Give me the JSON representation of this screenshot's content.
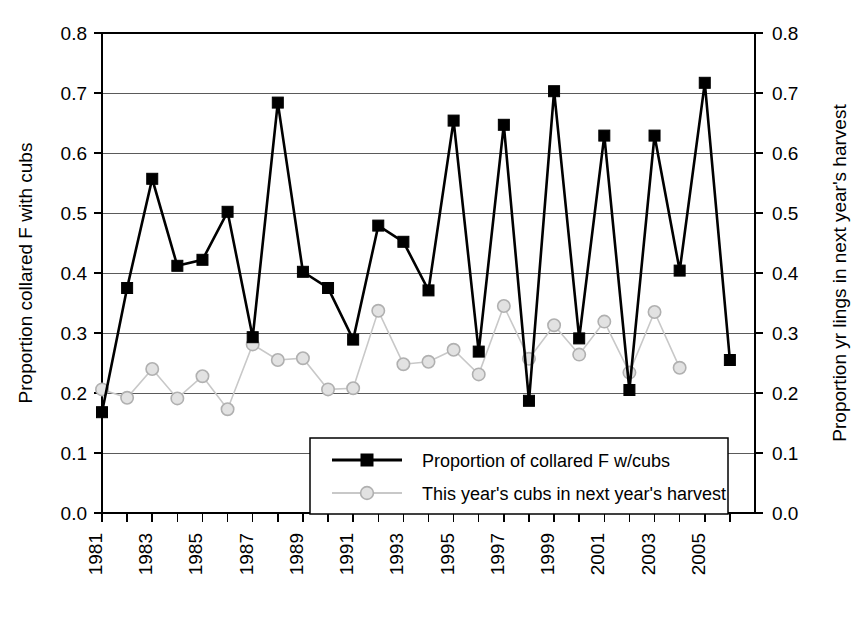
{
  "chart_data": {
    "type": "line",
    "title": "",
    "xlabel": "",
    "ylabel": "Proportion collared F with cubs",
    "y2label": "Proportion yr lings in next year's harvest",
    "ylim": [
      0.0,
      0.8
    ],
    "y2lim": [
      0.0,
      0.8
    ],
    "yticks": [
      "0.0",
      "0.1",
      "0.2",
      "0.3",
      "0.4",
      "0.5",
      "0.6",
      "0.7",
      "0.8"
    ],
    "y2ticks": [
      "0.0",
      "0.1",
      "0.2",
      "0.3",
      "0.4",
      "0.5",
      "0.6",
      "0.7",
      "0.8"
    ],
    "grid": true,
    "legend_position": "bottom-center",
    "x": [
      1981,
      1982,
      1983,
      1984,
      1985,
      1986,
      1987,
      1988,
      1989,
      1990,
      1991,
      1992,
      1993,
      1994,
      1995,
      1996,
      1997,
      1998,
      1999,
      2000,
      2001,
      2002,
      2003,
      2004,
      2005,
      2006
    ],
    "xtick_labels": [
      "1981",
      "",
      "1983",
      "",
      "1985",
      "",
      "1987",
      "",
      "1989",
      "",
      "1991",
      "",
      "1993",
      "",
      "1995",
      "",
      "1997",
      "",
      "1999",
      "",
      "2001",
      "",
      "2003",
      "",
      "2005",
      ""
    ],
    "series": [
      {
        "name": "Proportion of collared F w/cubs",
        "marker": "filled-square",
        "color": "#000000",
        "axis": "left",
        "x": [
          1981,
          1982,
          1983,
          1984,
          1985,
          1986,
          1987,
          1988,
          1989,
          1990,
          1991,
          1992,
          1993,
          1994,
          1995,
          1996,
          1997,
          1998,
          1999,
          2000,
          2001,
          2002,
          2003,
          2004,
          2005,
          2006
        ],
        "values": [
          0.168,
          0.375,
          0.557,
          0.412,
          0.422,
          0.502,
          0.293,
          0.684,
          0.402,
          0.375,
          0.289,
          0.479,
          0.452,
          0.371,
          0.654,
          0.269,
          0.647,
          0.187,
          0.703,
          0.291,
          0.629,
          0.205,
          0.629,
          0.404,
          0.717,
          0.255
        ]
      },
      {
        "name": "This year's cubs in next year's harvest",
        "marker": "open-circle",
        "color": "#c8c8c8",
        "axis": "right",
        "x": [
          1981,
          1982,
          1983,
          1984,
          1985,
          1986,
          1987,
          1988,
          1989,
          1990,
          1991,
          1992,
          1993,
          1994,
          1995,
          1996,
          1997,
          1998,
          1999,
          2000,
          2001,
          2002,
          2003,
          2004
        ],
        "values": [
          0.206,
          0.192,
          0.24,
          0.191,
          0.228,
          0.173,
          0.281,
          0.255,
          0.258,
          0.206,
          0.208,
          0.337,
          0.248,
          0.252,
          0.272,
          0.231,
          0.345,
          0.257,
          0.313,
          0.264,
          0.319,
          0.234,
          0.335,
          0.242
        ]
      }
    ]
  },
  "legend": {
    "entries": [
      {
        "label": "Proportion of collared F w/cubs",
        "marker": "filled-square",
        "color": "#000000"
      },
      {
        "label": "This year's cubs in next year's harvest",
        "marker": "open-circle",
        "color": "#c8c8c8"
      }
    ]
  },
  "left_axis": {
    "title": "Proportion collared F with cubs",
    "ticks": [
      "0.8",
      "0.7",
      "0.6",
      "0.5",
      "0.4",
      "0.3",
      "0.2",
      "0.1",
      "0.0"
    ]
  },
  "right_axis": {
    "title": "Proportion yr lings in next year's harvest",
    "ticks": [
      "0.8",
      "0.7",
      "0.6",
      "0.5",
      "0.4",
      "0.3",
      "0.2",
      "0.1",
      "0.0"
    ]
  },
  "x_axis": {
    "labels": [
      "1981",
      "1983",
      "1985",
      "1987",
      "1989",
      "1991",
      "1993",
      "1995",
      "1997",
      "1999",
      "2001",
      "2003",
      "2005"
    ]
  }
}
